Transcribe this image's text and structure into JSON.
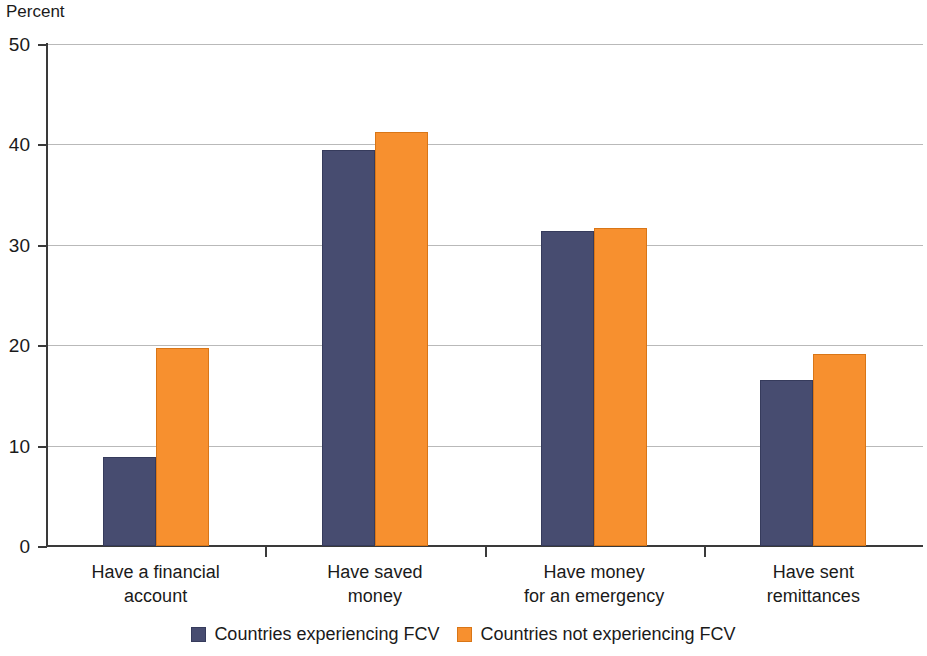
{
  "chart_data": {
    "type": "bar",
    "title": "",
    "subtitle": "",
    "xlabel": "",
    "ylabel": "Percent",
    "ylim": [
      0,
      50
    ],
    "yticks": [
      0,
      10,
      20,
      30,
      40,
      50
    ],
    "ytick_labels": [
      "0",
      "10",
      "20",
      "30",
      "40",
      "50"
    ],
    "grid": "horizontal",
    "legend_position": "bottom-center",
    "categories": [
      "Have a financial\naccount",
      "Have saved\nmoney",
      "Have money\nfor an emergency",
      "Have sent\nremittances"
    ],
    "category_lines": [
      [
        "Have a financial",
        "account"
      ],
      [
        "Have saved",
        "money"
      ],
      [
        "Have money",
        "for an emergency"
      ],
      [
        "Have sent",
        "remittances"
      ]
    ],
    "series": [
      {
        "name": "Countries experiencing FCV",
        "color": "#474c70",
        "values": [
          8.9,
          39.4,
          31.4,
          16.5
        ]
      },
      {
        "name": "Countries not experiencing FCV",
        "color": "#f7902f",
        "values": [
          19.7,
          41.2,
          31.7,
          19.1
        ]
      }
    ]
  },
  "legend": {
    "entries": [
      {
        "label": "Countries experiencing FCV"
      },
      {
        "label": "Countries not experiencing FCV"
      }
    ]
  }
}
